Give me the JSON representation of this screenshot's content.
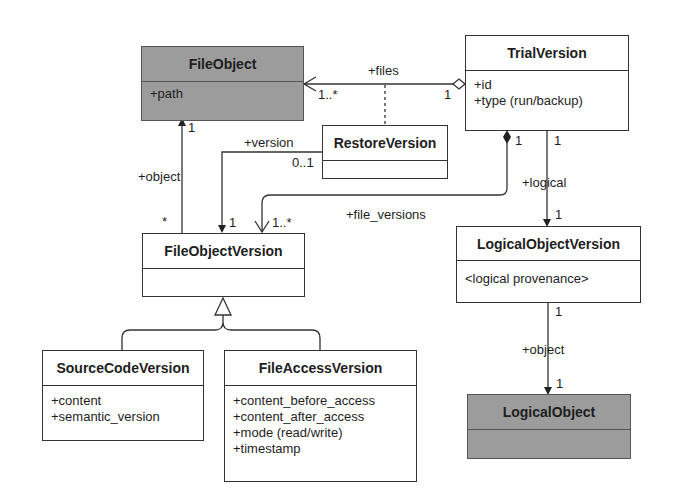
{
  "classes": {
    "file_object": {
      "name": "FileObject",
      "attributes": [
        "+path"
      ],
      "fill": "#9c9c9c"
    },
    "trial_version": {
      "name": "TrialVersion",
      "attributes": [
        "+id",
        "+type (run/backup)"
      ],
      "fill": "#ffffff"
    },
    "restore_version": {
      "name": "RestoreVersion",
      "attributes": [],
      "fill": "#ffffff"
    },
    "file_object_version": {
      "name": "FileObjectVersion",
      "attributes": [],
      "fill": "#ffffff"
    },
    "logical_object_version": {
      "name": "LogicalObjectVersion",
      "attributes": [
        "<logical provenance>"
      ],
      "fill": "#ffffff"
    },
    "source_code_version": {
      "name": "SourceCodeVersion",
      "attributes": [
        "+content",
        "+semantic_version"
      ],
      "fill": "#ffffff"
    },
    "file_access_version": {
      "name": "FileAccessVersion",
      "attributes": [
        "+content_before_access",
        "+content_after_access",
        "+mode (read/write)",
        "+timestamp"
      ],
      "fill": "#ffffff"
    },
    "logical_object": {
      "name": "LogicalObject",
      "attributes": [],
      "fill": "#9c9c9c"
    }
  },
  "associations": {
    "files": {
      "role": "+files",
      "source_mult": "1",
      "target_mult": "1..*"
    },
    "object": {
      "role": "+object",
      "source_mult": "*",
      "target_mult": "1"
    },
    "version": {
      "role": "+version",
      "source_mult": "0..1",
      "target_mult": "1"
    },
    "file_versions": {
      "role": "+file_versions",
      "source_mult": "1",
      "target_mult": "1..*"
    },
    "logical": {
      "role": "+logical",
      "source_mult": "1",
      "target_mult": "1"
    },
    "logical_object": {
      "role": "+object",
      "source_mult": "1",
      "target_mult": "1"
    }
  }
}
